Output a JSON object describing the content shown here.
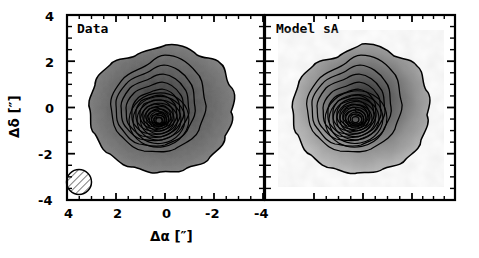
{
  "figure": {
    "width": 479,
    "height": 258,
    "background": "#ffffff",
    "frame_color": "#000000"
  },
  "axes": {
    "x": {
      "label": "Δα  [″]",
      "ticks": [
        "4",
        "2",
        "0",
        "-2",
        "-4"
      ],
      "range": [
        4,
        -4
      ],
      "minor_per_major": 4,
      "direction": "reversed"
    },
    "y": {
      "label": "Δδ  [″]",
      "ticks": [
        "4",
        "2",
        "0",
        "-2",
        "-4"
      ],
      "range": [
        -4,
        4
      ],
      "minor_per_major": 4
    }
  },
  "panels": [
    {
      "id": "data",
      "tag": "Data",
      "colormap": "grayscale-mottled",
      "has_beam": true,
      "beam": {
        "name": "beam-ellipse",
        "hatched": true,
        "x_arcsec": 3.1,
        "y_arcsec": -3.2,
        "radius_arcsec": 0.55
      }
    },
    {
      "id": "model",
      "tag": "Model sA",
      "colormap": "grayscale-smooth",
      "has_beam": false
    }
  ],
  "chart_data": {
    "type": "heatmap",
    "title": "",
    "xlabel": "Δα  [″]",
    "ylabel": "Δδ  [″]",
    "xlim": [
      4,
      -4
    ],
    "ylim": [
      -4,
      4
    ],
    "grid": false,
    "legend": "none",
    "panels": [
      {
        "name": "Data",
        "annotation": "Data",
        "contour_levels": [
          0.05,
          0.1,
          0.2,
          0.3,
          0.45,
          0.6,
          0.75,
          0.9,
          1.05,
          1.2,
          1.35,
          1.5,
          1.7,
          1.9,
          2.1,
          2.3,
          2.5,
          2.7,
          2.9,
          3.1
        ],
        "contour_count": 20,
        "peak_position": [
          -0.1,
          0.0
        ],
        "outer_extent_arcsec": 3.0,
        "image_min_gray": "#f2f2f2",
        "image_max_gray": "#4a4a4a"
      },
      {
        "name": "Model sA",
        "annotation": "Model sA",
        "contour_levels": [
          0.05,
          0.1,
          0.2,
          0.3,
          0.45,
          0.6,
          0.75,
          0.9,
          1.05,
          1.2,
          1.35,
          1.5,
          1.7,
          1.9,
          2.1,
          2.3,
          2.5,
          2.7,
          2.9,
          3.1
        ],
        "contour_count": 20,
        "peak_position": [
          -0.2,
          -0.1
        ],
        "outer_extent_arcsec": 3.0,
        "image_min_gray": "#e8e8e8",
        "image_max_gray": "#2e2e2e"
      }
    ]
  }
}
